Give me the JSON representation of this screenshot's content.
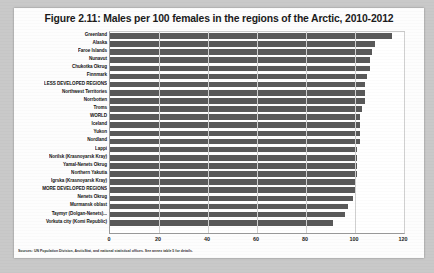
{
  "figure": {
    "title": "Figure 2.11: Males per 100 females in the regions of the Arctic, 2010-2012",
    "source_note": "Sources: UN Population Division, ArcticStat, and national statistical offices. See annex table 5 for details."
  },
  "chart_data": {
    "type": "bar",
    "orientation": "horizontal",
    "title": "Figure 2.11: Males per 100 females in the regions of the Arctic, 2010-2012",
    "xlabel": "",
    "ylabel": "",
    "xlim": [
      0,
      120
    ],
    "xticks": [
      0,
      20,
      40,
      60,
      80,
      100,
      120
    ],
    "grid": true,
    "legend": false,
    "bar_color": "#595959",
    "categories": [
      "Greenland",
      "Alaska",
      "Faroe Islands",
      "Nunavut",
      "Chukotka Okrug",
      "Finnmark",
      "LESS DEVELOPED REGIONS",
      "Northwest Territories",
      "Norrbotten",
      "Troms",
      "WORLD",
      "Iceland",
      "Yukon",
      "Nordland",
      "Lappi",
      "Norilsk (Krasnoyarsk Kray)",
      "Yamal-Nenets Okrug",
      "Northern Yakutia",
      "Igrska (Krasnoyarsk Kray)",
      "MORE DEVELOPED REGIONS",
      "Nenets Okrug",
      "Murmansk oblast",
      "Taymyr (Dolgan-Nenets)...",
      "Vorkuta city (Komi Republic)"
    ],
    "values": [
      115,
      108,
      107,
      106,
      106,
      105,
      104,
      104,
      104,
      103,
      102,
      102,
      102,
      102,
      101,
      101,
      101,
      101,
      100,
      100,
      99,
      97,
      96,
      91
    ]
  }
}
